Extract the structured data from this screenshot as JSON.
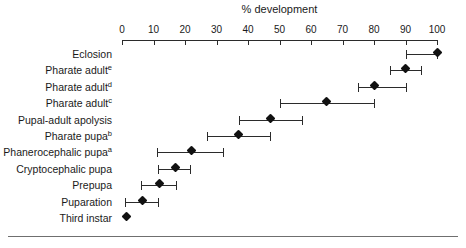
{
  "chart_data": {
    "type": "scatter",
    "title": "% development",
    "xlabel": "% development",
    "ylabel": "",
    "xlim": [
      0,
      100
    ],
    "grid": false,
    "legend": null,
    "orientation": "horizontal",
    "error_bars": "horizontal range",
    "tick_labels": [
      "0",
      "10",
      "20",
      "30",
      "40",
      "50",
      "60",
      "70",
      "80",
      "90",
      "100"
    ],
    "ticks": [
      0,
      10,
      20,
      30,
      40,
      50,
      60,
      70,
      80,
      90,
      100
    ],
    "categories": [
      "Eclosion",
      "Pharate adult",
      "Pharate adult",
      "Pharate adult",
      "Pupal-adult apolysis",
      "Pharate pupa",
      "Phanerocephalic pupa",
      "Cryptocephalic pupa",
      "Prepupa",
      "Puparation",
      "Third instar"
    ],
    "points": [
      {
        "label": "Eclosion",
        "superscript": "",
        "value": 100,
        "low": 90,
        "high": 100
      },
      {
        "label": "Pharate adult",
        "superscript": "e",
        "value": 90,
        "low": 85,
        "high": 95
      },
      {
        "label": "Pharate adult",
        "superscript": "d",
        "value": 80,
        "low": 75,
        "high": 90
      },
      {
        "label": "Pharate adult",
        "superscript": "c",
        "value": 65,
        "low": 50,
        "high": 80
      },
      {
        "label": "Pupal-adult apolysis",
        "superscript": "",
        "value": 47,
        "low": 37,
        "high": 57
      },
      {
        "label": "Pharate pupa",
        "superscript": "b",
        "value": 37,
        "low": 27,
        "high": 47
      },
      {
        "label": "Phanerocephalic pupa",
        "superscript": "a",
        "value": 22,
        "low": 11,
        "high": 32
      },
      {
        "label": "Cryptocephalic pupa",
        "superscript": "",
        "value": 17,
        "low": 11.5,
        "high": 21.5
      },
      {
        "label": "Prepupa",
        "superscript": "",
        "value": 12,
        "low": 6,
        "high": 17
      },
      {
        "label": "Puparation",
        "superscript": "",
        "value": 6.5,
        "low": 1,
        "high": 11.5
      },
      {
        "label": "Third instar",
        "superscript": "",
        "value": 1.5,
        "low": null,
        "high": null
      }
    ]
  }
}
